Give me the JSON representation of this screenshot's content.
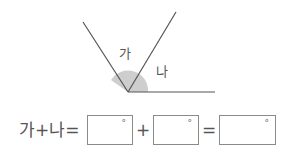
{
  "diagram": {
    "angle_a_label": "가",
    "angle_b_label": "나",
    "colors": {
      "line": "#555555",
      "arc_fill": "#bdbdbd"
    }
  },
  "equation": {
    "lhs": "가+나=",
    "plus": "+",
    "equals": "=",
    "boxes": [
      {
        "value": "",
        "unit": "°"
      },
      {
        "value": "",
        "unit": "°"
      },
      {
        "value": "",
        "unit": "°"
      }
    ]
  }
}
